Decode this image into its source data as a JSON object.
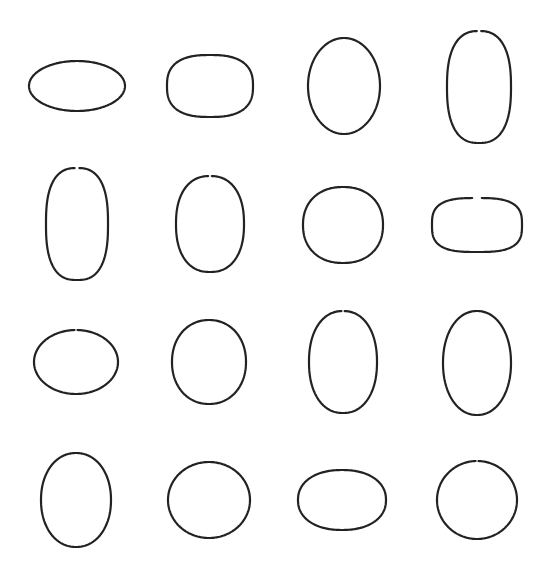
{
  "canvas": {
    "width": 549,
    "height": 574,
    "background": "#ffffff"
  },
  "stroke": {
    "color": "#222222",
    "width": 2.2
  },
  "shapes": [
    {
      "row": 1,
      "col": 1,
      "cx": 77,
      "cy": 86,
      "rx": 48,
      "ry": 25,
      "n": 2.0,
      "gap": false
    },
    {
      "row": 1,
      "col": 2,
      "cx": 210,
      "cy": 86,
      "rx": 43,
      "ry": 31,
      "n": 2.6,
      "gap": false
    },
    {
      "row": 1,
      "col": 3,
      "cx": 344,
      "cy": 86,
      "rx": 36,
      "ry": 48,
      "n": 2.0,
      "gap": false
    },
    {
      "row": 1,
      "col": 4,
      "cx": 479,
      "cy": 87,
      "rx": 32,
      "ry": 56,
      "n": 2.5,
      "gap": true
    },
    {
      "row": 2,
      "col": 1,
      "cx": 77,
      "cy": 224,
      "rx": 31,
      "ry": 56,
      "n": 2.6,
      "gap": true
    },
    {
      "row": 2,
      "col": 2,
      "cx": 210,
      "cy": 224,
      "rx": 34,
      "ry": 48,
      "n": 2.3,
      "gap": true
    },
    {
      "row": 2,
      "col": 3,
      "cx": 343,
      "cy": 225,
      "rx": 40,
      "ry": 38,
      "n": 2.2,
      "gap": false
    },
    {
      "row": 2,
      "col": 4,
      "cx": 477,
      "cy": 225,
      "rx": 45,
      "ry": 27,
      "n": 3.0,
      "gap": true
    },
    {
      "row": 3,
      "col": 1,
      "cx": 76,
      "cy": 362,
      "rx": 42,
      "ry": 32,
      "n": 2.0,
      "gap": true
    },
    {
      "row": 3,
      "col": 2,
      "cx": 209,
      "cy": 362,
      "rx": 37,
      "ry": 42,
      "n": 2.1,
      "gap": false
    },
    {
      "row": 3,
      "col": 3,
      "cx": 343,
      "cy": 362,
      "rx": 34,
      "ry": 51,
      "n": 2.2,
      "gap": true
    },
    {
      "row": 3,
      "col": 4,
      "cx": 477,
      "cy": 363,
      "rx": 34,
      "ry": 52,
      "n": 2.1,
      "gap": false
    },
    {
      "row": 4,
      "col": 1,
      "cx": 76,
      "cy": 500,
      "rx": 35,
      "ry": 47,
      "n": 2.1,
      "gap": false
    },
    {
      "row": 4,
      "col": 2,
      "cx": 209,
      "cy": 500,
      "rx": 41,
      "ry": 38,
      "n": 2.0,
      "gap": false
    },
    {
      "row": 4,
      "col": 3,
      "cx": 342,
      "cy": 500,
      "rx": 44,
      "ry": 30,
      "n": 2.2,
      "gap": false
    },
    {
      "row": 4,
      "col": 4,
      "cx": 477,
      "cy": 500,
      "rx": 40,
      "ry": 39,
      "n": 2.0,
      "gap": true
    }
  ]
}
